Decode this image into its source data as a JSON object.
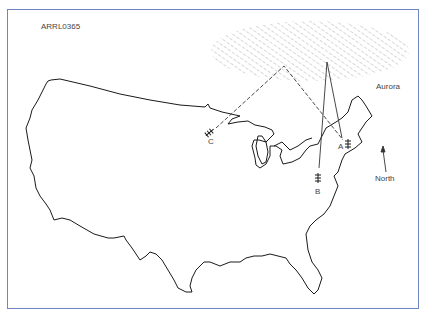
{
  "figure": {
    "id_label": "ARRL0365",
    "border_color": "#6f86c4",
    "line_color": "#1a1a1a",
    "hatch_color": "#9a9a9a"
  },
  "labels": {
    "aurora": "Aurora",
    "north": "North",
    "station_a": "A",
    "station_b": "B",
    "station_c": "C"
  },
  "legend": {
    "aurora_region": "hatched-ellipse",
    "paths": [
      {
        "from": "C",
        "via": "aurora-reflection-point",
        "to": "A",
        "style": "dashed"
      },
      {
        "from": "B",
        "via": "aurora-reflection-point",
        "to": "A",
        "style": "solid"
      }
    ]
  },
  "icons": {
    "antenna": "yagi-antenna-icon",
    "north_arrow": "arrow-up-icon"
  }
}
